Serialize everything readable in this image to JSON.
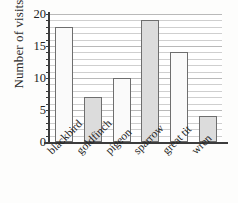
{
  "chart_data": {
    "type": "bar",
    "title": "",
    "subtitle": "",
    "xlabel": "",
    "ylabel": "Number of visits",
    "categories": [
      "blackbird",
      "goldfinch",
      "pigeon",
      "sparrow",
      "great tit",
      "wren"
    ],
    "values": [
      18,
      7,
      10,
      19,
      14,
      4
    ],
    "series": [
      {
        "name": "Number of visits",
        "values": [
          18,
          7,
          10,
          19,
          14,
          4
        ]
      }
    ],
    "bar_fills": [
      "#fafafa",
      "#dcdcdc",
      "#fafafa",
      "#dcdcdc",
      "#fafafa",
      "#dcdcdc"
    ],
    "bar_edge_color": "#6e6e6e",
    "ylim": [
      0,
      20
    ],
    "y_ticks": [
      0,
      5,
      10,
      15,
      20
    ],
    "y_tick_labels": [
      "0",
      "5",
      "10",
      "15",
      "20"
    ],
    "y_minor_tick_step": 1,
    "grid": true,
    "grid_orientation": "horizontal",
    "grid_color": "#cfcfcf",
    "legend": false,
    "legend_position": "none",
    "axis_color": "#3c3c3c",
    "background_color": "#fdfdfc",
    "plot_background_color": "#ffffff",
    "x_tick_label_rotation": -45
  }
}
